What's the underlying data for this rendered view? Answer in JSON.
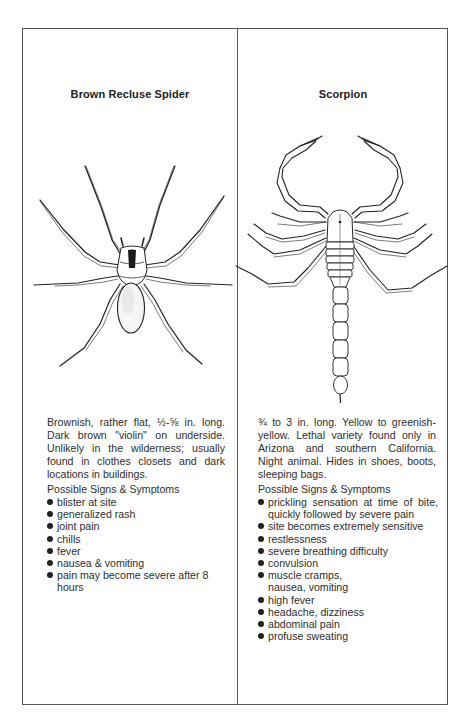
{
  "page": {
    "columns": [
      {
        "id": "brown-recluse",
        "title": "Brown Recluse Spider",
        "illustration": "brown-recluse-spider-drawing",
        "description": "Brownish, rather flat, ½-⅝ in. long. Dark brown \"violin\" on underside. Unlikely in the wilderness; usually found in clothes closets and dark locations in buildings.",
        "signs_heading": "Possible Signs & Symptoms",
        "signs": [
          "blister at site",
          "generalized rash",
          "joint pain",
          "chills",
          "fever",
          "nausea & vomiting",
          "pain may become severe after 8 hours"
        ]
      },
      {
        "id": "scorpion",
        "title": "Scorpion",
        "illustration": "scorpion-drawing",
        "description": "¾ to 3 in. long. Yellow to greenish-yellow. Lethal variety found only in Arizona and southern California. Night animal. Hides in shoes, boots, sleeping bags.",
        "signs_heading": "Possible Signs & Symptoms",
        "signs": [
          "prickling sensation at time of bite, quickly followed by severe pain",
          "site becomes extremely sensitive",
          "restlessness",
          "severe breathing difficulty",
          "convulsion",
          "muscle cramps, nausea, vomiting",
          "high fever",
          "headache, dizziness",
          "abdominal pain",
          "profuse sweating"
        ]
      }
    ],
    "colors": {
      "ink": "#2a2a2a",
      "border": "#555555",
      "background": "#ffffff"
    }
  }
}
